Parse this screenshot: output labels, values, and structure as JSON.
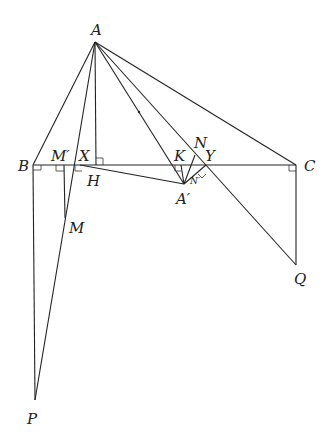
{
  "diagram": {
    "type": "geometry-figure",
    "points": {
      "A": {
        "label": "A",
        "x": 95,
        "y": 42,
        "lx": 91,
        "ly": 35
      },
      "B": {
        "label": "B",
        "x": 33,
        "y": 165,
        "lx": 18,
        "ly": 171
      },
      "C": {
        "label": "C",
        "x": 296,
        "y": 165,
        "lx": 304,
        "ly": 171
      },
      "M'": {
        "label": "M′",
        "x": 64,
        "y": 165,
        "lx": 51,
        "ly": 161
      },
      "X": {
        "label": "X",
        "x": 75,
        "y": 165,
        "lx": 79,
        "ly": 161
      },
      "H": {
        "label": "H",
        "x": 84,
        "y": 167,
        "lx": 87,
        "ly": 186
      },
      "F": {
        "label": "",
        "x": 96,
        "y": 165
      },
      "M": {
        "label": "M",
        "x": 65,
        "y": 218,
        "lx": 69,
        "ly": 233
      },
      "P": {
        "label": "P",
        "x": 35,
        "y": 400,
        "lx": 27,
        "ly": 424
      },
      "K": {
        "label": "K",
        "x": 181,
        "y": 165,
        "lx": 174,
        "ly": 161
      },
      "N": {
        "label": "N",
        "x": 195,
        "y": 155,
        "lx": 194,
        "ly": 148
      },
      "Y": {
        "label": "Y",
        "x": 206,
        "y": 165,
        "lx": 205,
        "ly": 161
      },
      "A'": {
        "label": "A′",
        "x": 184,
        "y": 184,
        "lx": 176,
        "ly": 204
      },
      "N'": {
        "label": "N′",
        "x": 191,
        "y": 178,
        "lx": 190,
        "ly": 184
      },
      "Q": {
        "label": "Q",
        "x": 296,
        "y": 265,
        "lx": 294,
        "ly": 284
      }
    },
    "labels": [
      "A",
      "B",
      "C",
      "M′",
      "X",
      "H",
      "M",
      "P",
      "K",
      "N",
      "Y",
      "A′",
      "Q"
    ]
  }
}
